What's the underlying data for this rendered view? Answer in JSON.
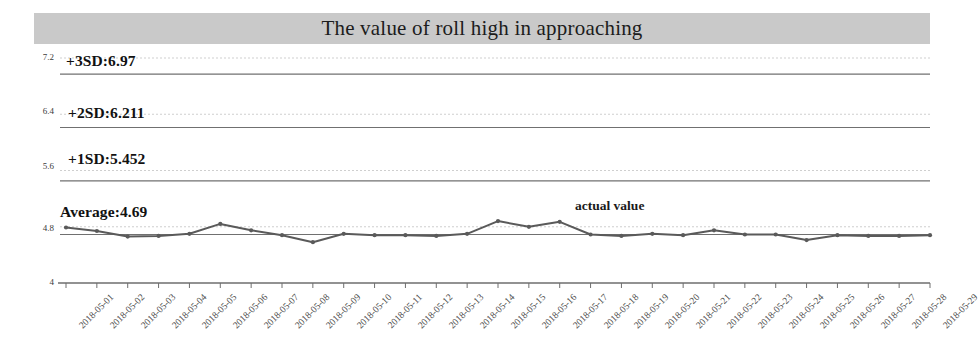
{
  "title": "The value of roll high in approaching",
  "legend": {
    "series_label": "actual value"
  },
  "bands": [
    {
      "name": "plus3sd",
      "label": "+3SD:6.97",
      "value": 6.97
    },
    {
      "name": "plus2sd",
      "label": "+2SD:6.211",
      "value": 6.211
    },
    {
      "name": "plus1sd",
      "label": "+1SD:5.452",
      "value": 5.452
    },
    {
      "name": "average",
      "label": "Average:4.69",
      "value": 4.69
    }
  ],
  "axis": {
    "y_ticks": [
      "7.2",
      "6.4",
      "5.6",
      "4.8",
      "4"
    ],
    "y_min": 4,
    "y_max": 7.2
  },
  "chart_data": {
    "type": "line",
    "title": "The value of roll high in approaching",
    "xlabel": "",
    "ylabel": "",
    "ylim": [
      4,
      7.2
    ],
    "yticks": [
      4,
      4.8,
      5.6,
      6.4,
      7.2
    ],
    "grid": true,
    "legend_position": "inline-right",
    "categories": [
      "2018-05-01",
      "2018-05-02",
      "2018-05-03",
      "2018-05-04",
      "2018-05-05",
      "2018-05-06",
      "2018-05-07",
      "2018-05-08",
      "2018-05-09",
      "2018-05-10",
      "2018-05-11",
      "2018-05-12",
      "2018-05-13",
      "2018-05-14",
      "2018-05-15",
      "2018-05-16",
      "2018-05-17",
      "2018-05-18",
      "2018-05-19",
      "2018-05-20",
      "2018-05-21",
      "2018-05-22",
      "2018-05-23",
      "2018-05-24",
      "2018-05-25",
      "2018-05-26",
      "2018-05-27",
      "2018-05-28",
      "2018-05-29"
    ],
    "series": [
      {
        "name": "actual value",
        "values": [
          4.79,
          4.74,
          4.66,
          4.67,
          4.7,
          4.84,
          4.75,
          4.68,
          4.58,
          4.7,
          4.68,
          4.68,
          4.67,
          4.7,
          4.88,
          4.8,
          4.87,
          4.69,
          4.67,
          4.7,
          4.68,
          4.75,
          4.69,
          4.69,
          4.61,
          4.68,
          4.67,
          4.67,
          4.68
        ]
      }
    ],
    "reference_lines": [
      {
        "label": "+3SD:6.97",
        "value": 6.97
      },
      {
        "label": "+2SD:6.211",
        "value": 6.211
      },
      {
        "label": "+1SD:5.452",
        "value": 5.452
      },
      {
        "label": "Average:4.69",
        "value": 4.69
      }
    ]
  },
  "colors": {
    "banner": "#c9c9c9",
    "series": "#5a5a5a",
    "grid": "#b8b8b8",
    "axis": "#888888",
    "text": "#111111"
  }
}
